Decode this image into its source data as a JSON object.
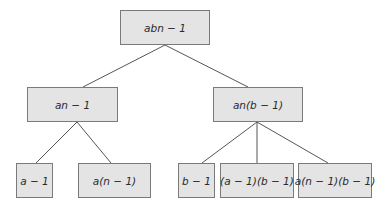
{
  "diagram": {
    "type": "tree",
    "colors": {
      "box_fill": "#e4e4e4",
      "box_border": "#7a7a7a",
      "edge": "#555555",
      "text": "#2a2a2a"
    },
    "nodes": [
      {
        "id": "root",
        "label": "abn − 1",
        "x": 120,
        "y": 10,
        "w": 90,
        "h": 35
      },
      {
        "id": "left",
        "label": "an − 1",
        "x": 27,
        "y": 87,
        "w": 91,
        "h": 35
      },
      {
        "id": "right",
        "label": "an(b − 1)",
        "x": 213,
        "y": 87,
        "w": 90,
        "h": 35
      },
      {
        "id": "ll",
        "label": "a − 1",
        "x": 16,
        "y": 163,
        "w": 37,
        "h": 35
      },
      {
        "id": "lr",
        "label": "a(n − 1)",
        "x": 78,
        "y": 163,
        "w": 73,
        "h": 35
      },
      {
        "id": "rl",
        "label": "b − 1",
        "x": 178,
        "y": 163,
        "w": 37,
        "h": 35
      },
      {
        "id": "rm",
        "label": "(a − 1)(b − 1)",
        "x": 220,
        "y": 163,
        "w": 74,
        "h": 35
      },
      {
        "id": "rr",
        "label": "a(n − 1)(b − 1)",
        "x": 298,
        "y": 163,
        "w": 74,
        "h": 35
      }
    ],
    "edges": [
      {
        "from": [
          165,
          45
        ],
        "to": [
          83,
          87
        ]
      },
      {
        "from": [
          165,
          45
        ],
        "to": [
          248,
          87
        ]
      },
      {
        "from": [
          77,
          122
        ],
        "to": [
          36,
          163
        ]
      },
      {
        "from": [
          77,
          122
        ],
        "to": [
          111,
          163
        ]
      },
      {
        "from": [
          257,
          122
        ],
        "to": [
          202,
          163
        ]
      },
      {
        "from": [
          257,
          122
        ],
        "to": [
          257,
          163
        ]
      },
      {
        "from": [
          257,
          122
        ],
        "to": [
          328,
          163
        ]
      }
    ]
  }
}
